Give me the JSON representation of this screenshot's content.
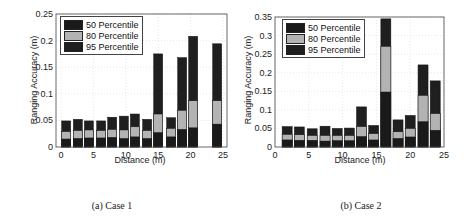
{
  "colors": {
    "p50": "#1a1a1a",
    "p80": "#b3b3b3",
    "p95": "#1f1f1f",
    "grid": "#dddddd",
    "axis": "#444444"
  },
  "panels": [
    {
      "caption": "(a) Case 1",
      "xlabel": "Distance (m)",
      "ylabel": "Ranging Accuracy (m)"
    },
    {
      "caption": "(b) Case 2",
      "xlabel": "Distance (m)",
      "ylabel": "Ranging Accuracy (m)"
    }
  ],
  "legend": [
    "50 Percentile",
    "80 Percentile",
    "95 Percentile"
  ],
  "chart_data": [
    {
      "type": "bar",
      "stacked": "overlaid",
      "title": "(a) Case 1",
      "xlabel": "Distance (m)",
      "ylabel": "Ranging Accuracy (m)",
      "xlim": [
        -1,
        26
      ],
      "ylim": [
        0,
        0.25
      ],
      "xticks": [
        0,
        5,
        10,
        15,
        20,
        25
      ],
      "yticks": [
        0,
        0.05,
        0.1,
        0.15,
        0.2,
        0.25
      ],
      "ytick_labels": [
        "0",
        "0.05",
        "0.1",
        "0.15",
        "0.2",
        "0.25"
      ],
      "grid": true,
      "legend_position": "upper left",
      "x": [
        0.8,
        2.6,
        4.3,
        6.2,
        7.9,
        9.7,
        11.4,
        13.3,
        15.0,
        17.0,
        18.7,
        20.4,
        24.1
      ],
      "series": [
        {
          "name": "50 Percentile",
          "values": [
            0.015,
            0.016,
            0.017,
            0.017,
            0.018,
            0.016,
            0.019,
            0.016,
            0.027,
            0.019,
            0.033,
            0.036,
            0.043
          ]
        },
        {
          "name": "80 Percentile",
          "values": [
            0.029,
            0.031,
            0.032,
            0.031,
            0.033,
            0.032,
            0.038,
            0.031,
            0.062,
            0.035,
            0.069,
            0.087,
            0.087
          ]
        },
        {
          "name": "95 Percentile",
          "values": [
            0.049,
            0.052,
            0.049,
            0.049,
            0.056,
            0.058,
            0.062,
            0.052,
            0.175,
            0.055,
            0.168,
            0.208,
            0.194
          ]
        }
      ]
    },
    {
      "type": "bar",
      "stacked": "overlaid",
      "title": "(b) Case 2",
      "xlabel": "Distance (m)",
      "ylabel": "Ranging Accuracy (m)",
      "xlim": [
        0,
        25
      ],
      "ylim": [
        0,
        0.35
      ],
      "xticks": [
        0,
        5,
        10,
        15,
        20,
        25
      ],
      "yticks": [
        0,
        0.05,
        0.1,
        0.15,
        0.2,
        0.25,
        0.3,
        0.35
      ],
      "ytick_labels": [
        "0",
        "0.05",
        "0.1",
        "0.15",
        "0.2",
        "0.25",
        "0.3",
        "0.35"
      ],
      "grid": true,
      "legend_position": "upper left",
      "x": [
        1.8,
        3.6,
        5.5,
        7.4,
        9.2,
        11.0,
        12.8,
        14.6,
        16.4,
        18.2,
        20.0,
        21.9,
        23.7
      ],
      "series": [
        {
          "name": "50 Percentile",
          "values": [
            0.019,
            0.018,
            0.018,
            0.016,
            0.017,
            0.017,
            0.028,
            0.019,
            0.148,
            0.023,
            0.027,
            0.068,
            0.045
          ]
        },
        {
          "name": "80 Percentile",
          "values": [
            0.034,
            0.033,
            0.031,
            0.031,
            0.031,
            0.031,
            0.055,
            0.036,
            0.271,
            0.041,
            0.05,
            0.139,
            0.09
          ]
        },
        {
          "name": "95 Percentile",
          "values": [
            0.055,
            0.054,
            0.049,
            0.056,
            0.05,
            0.051,
            0.108,
            0.058,
            0.345,
            0.073,
            0.085,
            0.221,
            0.178
          ]
        }
      ]
    }
  ],
  "layout": [
    {
      "plot": {
        "x0": 56,
        "x1": 227,
        "y0": 14,
        "y1": 147
      },
      "xmap": {
        "x0": 61,
        "x1": 223,
        "v0": 0,
        "v1": 25
      },
      "barw": 9,
      "legend": {
        "left": 60,
        "top": 16
      }
    },
    {
      "plot": {
        "x0": 35,
        "x1": 204,
        "y0": 17,
        "y1": 147
      },
      "xmap": {
        "x0": 35,
        "x1": 204,
        "v0": 0,
        "v1": 25
      },
      "barw": 10,
      "legend": {
        "left": 42,
        "top": 19
      }
    }
  ]
}
